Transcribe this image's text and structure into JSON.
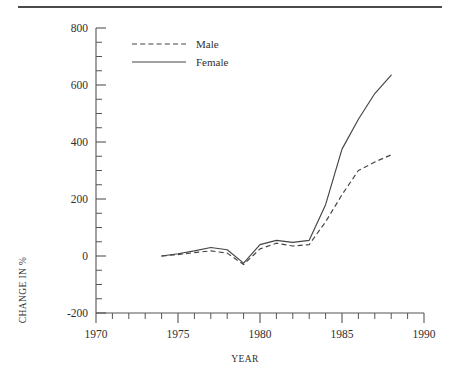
{
  "figure": {
    "has_top_rule": true,
    "background": "#ffffff",
    "ink_color": "#444444"
  },
  "chart_data": {
    "type": "line",
    "title": "",
    "subtitle": "",
    "xlabel": "YEAR",
    "ylabel": "CHANGE IN %",
    "xlim": [
      1970,
      1990
    ],
    "ylim": [
      -200,
      800
    ],
    "xticks": [
      1970,
      1975,
      1980,
      1985,
      1990
    ],
    "xtick_labels": [
      "1970",
      "1975",
      "1980",
      "1985",
      "1990"
    ],
    "x_minor_tick_interval": 1,
    "yticks": [
      -200,
      0,
      200,
      400,
      600,
      800
    ],
    "ytick_labels": [
      "-200",
      "0",
      "200",
      "400",
      "600",
      "800"
    ],
    "y_minor_tick_interval": 50,
    "grid": false,
    "legend_position": "top-left-inside",
    "x": [
      1974,
      1975,
      1976,
      1977,
      1978,
      1979,
      1980,
      1981,
      1982,
      1983,
      1984,
      1985,
      1986,
      1987,
      1988
    ],
    "series": [
      {
        "name": "Male",
        "style": "dashed",
        "color": "#444444",
        "values": [
          0,
          5,
          12,
          18,
          10,
          -30,
          25,
          45,
          35,
          40,
          120,
          215,
          300,
          330,
          355
        ]
      },
      {
        "name": "Female",
        "style": "solid",
        "color": "#444444",
        "values": [
          0,
          8,
          18,
          30,
          22,
          -25,
          40,
          55,
          48,
          55,
          180,
          375,
          480,
          570,
          635
        ]
      }
    ],
    "annotations": []
  },
  "legend": {
    "entries": [
      {
        "label": "Male",
        "style": "dashed"
      },
      {
        "label": "Female",
        "style": "solid"
      }
    ]
  }
}
